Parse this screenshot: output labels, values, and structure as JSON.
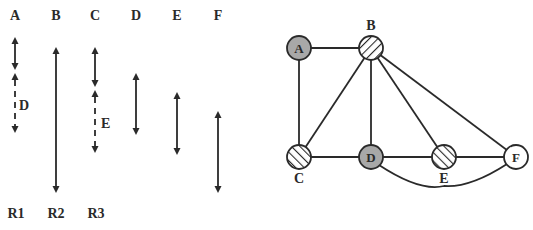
{
  "figure": {
    "left_panel": {
      "column_labels": [
        {
          "id": "A",
          "label": "A",
          "x": 15
        },
        {
          "id": "B",
          "label": "B",
          "x": 56
        },
        {
          "id": "C",
          "label": "C",
          "x": 95
        },
        {
          "id": "D",
          "label": "D",
          "x": 136
        },
        {
          "id": "E",
          "label": "E",
          "x": 177
        },
        {
          "id": "F",
          "label": "F",
          "x": 218
        }
      ],
      "row_labels": [
        {
          "id": "R1",
          "label": "R1",
          "x": 16
        },
        {
          "id": "R2",
          "label": "R2",
          "x": 56
        },
        {
          "id": "R3",
          "label": "R3",
          "x": 96
        }
      ],
      "intervals": [
        {
          "column": "A",
          "style": "solid",
          "y1": 37,
          "y2": 70
        },
        {
          "column": "A",
          "style": "dashed",
          "y1": 73,
          "y2": 133,
          "label": "D"
        },
        {
          "column": "B",
          "style": "solid",
          "y1": 47,
          "y2": 193
        },
        {
          "column": "C",
          "style": "solid",
          "y1": 47,
          "y2": 87
        },
        {
          "column": "C",
          "style": "dashed",
          "y1": 90,
          "y2": 153,
          "label": "E"
        },
        {
          "column": "D",
          "style": "solid",
          "y1": 73,
          "y2": 135
        },
        {
          "column": "E",
          "style": "solid",
          "y1": 92,
          "y2": 155
        },
        {
          "column": "F",
          "style": "solid",
          "y1": 111,
          "y2": 193
        }
      ]
    },
    "graph": {
      "nodes": [
        {
          "id": "A",
          "label": "A",
          "fill": "gray",
          "label_inside": true
        },
        {
          "id": "B",
          "label": "B",
          "fill": "hatched-back",
          "label_inside": false
        },
        {
          "id": "C",
          "label": "C",
          "fill": "hatched-fwd",
          "label_inside": false
        },
        {
          "id": "D",
          "label": "D",
          "fill": "gray",
          "label_inside": true
        },
        {
          "id": "E",
          "label": "E",
          "fill": "hatched-fwd",
          "label_inside": false
        },
        {
          "id": "F",
          "label": "F",
          "fill": "white",
          "label_inside": true
        }
      ],
      "edges": [
        [
          "A",
          "B"
        ],
        [
          "A",
          "C"
        ],
        [
          "B",
          "C"
        ],
        [
          "B",
          "D"
        ],
        [
          "B",
          "E"
        ],
        [
          "B",
          "F"
        ],
        [
          "C",
          "D"
        ],
        [
          "D",
          "E"
        ],
        [
          "E",
          "F"
        ],
        [
          "D",
          "F (curved)"
        ]
      ],
      "colors": {
        "gray_fill": "#a8a8a8",
        "stroke": "#2a2a2a",
        "white_fill": "#ffffff"
      }
    }
  }
}
